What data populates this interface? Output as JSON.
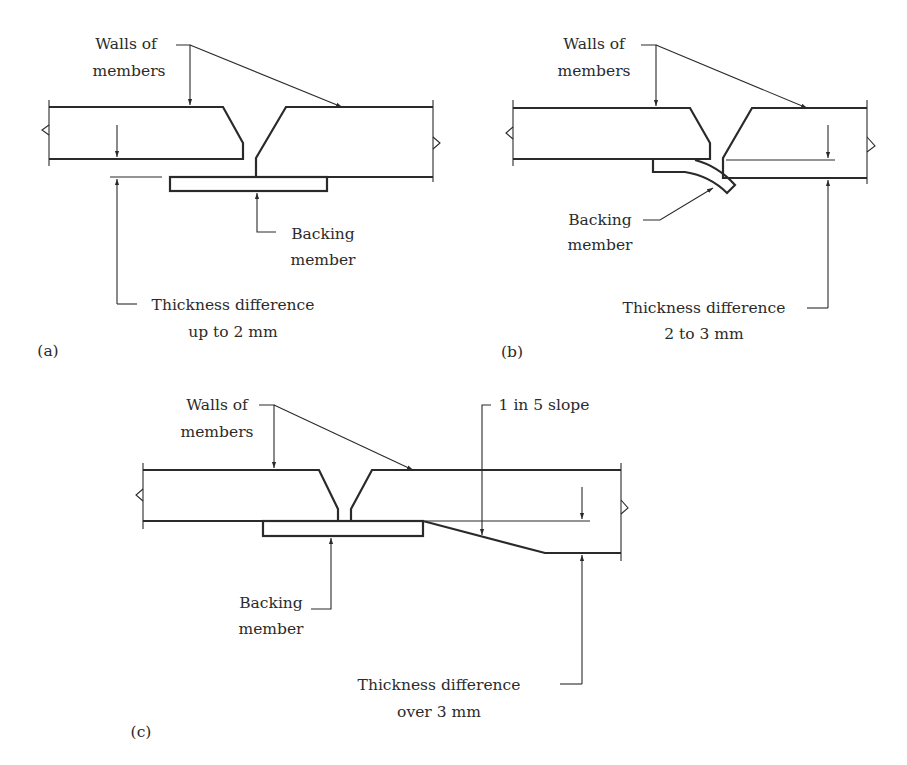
{
  "figure": {
    "panels": [
      {
        "id": "a",
        "tag": "(a)",
        "walls_label": [
          "Walls of",
          "members"
        ],
        "backing_label": [
          "Backing",
          "member"
        ],
        "thickness_label": [
          "Thickness difference",
          "up to 2 mm"
        ]
      },
      {
        "id": "b",
        "tag": "(b)",
        "walls_label": [
          "Walls of",
          "members"
        ],
        "backing_label": [
          "Backing",
          "member"
        ],
        "thickness_label": [
          "Thickness difference",
          "2 to 3 mm"
        ]
      },
      {
        "id": "c",
        "tag": "(c)",
        "walls_label": [
          "Walls of",
          "members"
        ],
        "backing_label": [
          "Backing",
          "member"
        ],
        "thickness_label": [
          "Thickness difference",
          "over 3 mm"
        ],
        "slope_label": "1 in 5 slope"
      }
    ],
    "colors": {
      "line": "#2a2a2a",
      "text": "#2b2b2b",
      "background": "#ffffff"
    }
  }
}
